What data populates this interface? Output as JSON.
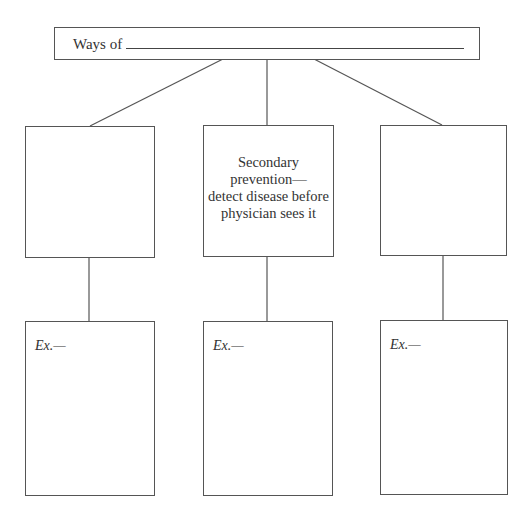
{
  "title_box": {
    "prefix": "Ways of",
    "blank": ""
  },
  "middle_boxes": [
    {
      "text": ""
    },
    {
      "lines": [
        "Secondary",
        "prevention—",
        "detect disease before",
        "physician sees it"
      ]
    },
    {
      "text": ""
    }
  ],
  "example_boxes": [
    {
      "label": "Ex.—"
    },
    {
      "label": "Ex.—"
    },
    {
      "label": "Ex.—"
    }
  ]
}
